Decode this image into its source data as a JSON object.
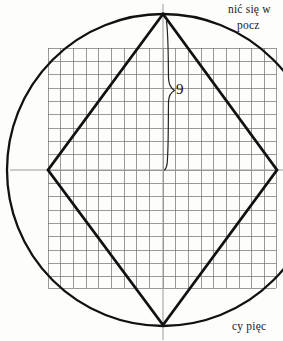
{
  "figure": {
    "colors": {
      "background": "#fdfdfc",
      "stroke_heavy": "#111111",
      "stroke_grid": "#6e6e6e",
      "stroke_axis": "#8a8a8a",
      "text": "#1a1a1a"
    },
    "circle": {
      "center_x": 163,
      "center_y": 170,
      "radius": 156,
      "stroke_width": 2.2
    },
    "rhombus": {
      "vertices": [
        {
          "name": "top",
          "x": 163,
          "y": 14
        },
        {
          "name": "right",
          "x": 277,
          "y": 170
        },
        {
          "name": "bottom",
          "x": 163,
          "y": 325
        },
        {
          "name": "left",
          "x": 48,
          "y": 170
        }
      ],
      "stroke_width": 2.6
    },
    "grid": {
      "left": 48,
      "top": 48,
      "right": 276,
      "bottom": 288,
      "columns": 18,
      "rows": 18,
      "cell_width": 12.67,
      "cell_height": 13.33,
      "stroke_width": 0.7
    },
    "axes": {
      "horizontal": {
        "x1": 12,
        "y1": 170,
        "x2": 283,
        "y2": 170
      },
      "vertical": {
        "x1": 163,
        "y1": 6,
        "x2": 163,
        "y2": 338
      },
      "stroke_width": 1.0
    },
    "dimension": {
      "label": "9",
      "brace_x": 167,
      "brace_top": 20,
      "brace_bottom": 170,
      "tip_x": 175,
      "tip_y": 91
    }
  },
  "annotations": {
    "top_right_line_1": "nić się w",
    "top_right_line_2": "pocz",
    "bottom_right_line": "cy pięc"
  }
}
